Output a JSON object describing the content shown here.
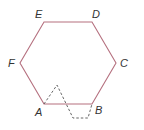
{
  "diagram": {
    "type": "regular hexagon with dashed folded triangle",
    "hexagon": {
      "color": "#b5707f",
      "vertices": [
        {
          "label": "A",
          "x": 44,
          "y": 104
        },
        {
          "label": "B",
          "x": 92,
          "y": 104
        },
        {
          "label": "C",
          "x": 116,
          "y": 63
        },
        {
          "label": "D",
          "x": 92,
          "y": 22
        },
        {
          "label": "E",
          "x": 44,
          "y": 22
        },
        {
          "label": "F",
          "x": 20,
          "y": 63
        }
      ]
    },
    "dashed_path": {
      "color": "#555555",
      "points": [
        [
          44,
          104
        ],
        [
          57,
          85
        ],
        [
          73,
          118
        ],
        [
          88,
          118
        ],
        [
          92,
          104
        ]
      ]
    },
    "labels": {
      "A": "A",
      "B": "B",
      "C": "C",
      "D": "D",
      "E": "E",
      "F": "F"
    }
  }
}
